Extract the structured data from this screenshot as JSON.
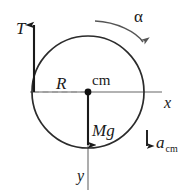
{
  "figure": {
    "kind": "physics-free-body-diagram",
    "colors": {
      "stroke_dark": "#1a1a1a",
      "stroke_axis": "#8a8a8a",
      "stroke_circle": "#333333",
      "background": "#ffffff"
    },
    "labels": {
      "tension": "T",
      "radius": "R",
      "center_of_mass": "cm",
      "x_axis": "x",
      "y_axis": "y",
      "weight": "Mg",
      "angular_acceleration": "α",
      "acceleration_symbol": "a",
      "acceleration_subscript": "cm"
    },
    "elements": {
      "circle": {
        "cx": 88,
        "cy": 92,
        "r": 56
      },
      "center_dot": {
        "cx": 88,
        "cy": 92,
        "r": 3.2
      },
      "tension_arrow": {
        "x": 34,
        "y_tail": 92,
        "y_tip": 19,
        "direction": "up"
      },
      "weight_arrow": {
        "x": 88,
        "y_tail": 92,
        "y_tip": 151,
        "direction": "down"
      },
      "acceleration_arrow": {
        "x": 147,
        "y_tail": 130,
        "y_tip": 152,
        "direction": "down"
      },
      "x_axis_line": {
        "x1": 33,
        "y1": 92,
        "x2": 162,
        "y2": 92
      },
      "y_axis_line": {
        "x1": 88,
        "y1": 92,
        "x2": 88,
        "y2": 190
      },
      "radius_dashes": {
        "x1": 33,
        "y1": 92,
        "x2": 88,
        "y2": 92
      },
      "alpha_arc": {
        "from": [
          96,
          21
        ],
        "to": [
          144,
          48
        ],
        "direction": "clockwise"
      }
    }
  }
}
